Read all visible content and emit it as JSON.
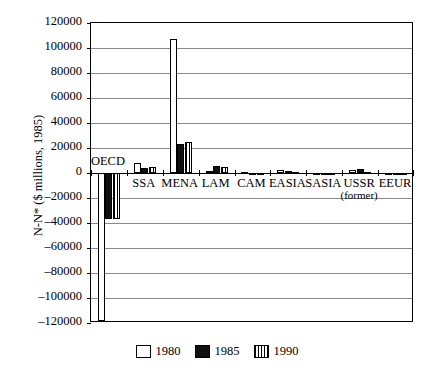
{
  "chart_data": {
    "type": "bar",
    "title": "",
    "xlabel": "",
    "ylabel": "N-N* ($ millions, 1985)",
    "ylim": [
      -120000,
      120000
    ],
    "ytick_step": 20000,
    "grid": true,
    "legend_position": "bottom",
    "categories": [
      "OECD",
      "SSA",
      "MENA",
      "LAM",
      "CAM",
      "EASIA",
      "SASIA",
      "USSR",
      "EEUR"
    ],
    "category_sublabels": {
      "USSR": "(former)"
    },
    "ytick_labels": [
      "120000",
      "100000",
      "80000",
      "60000",
      "40000",
      "20000",
      "0",
      "-20000",
      "-40000",
      "-60000",
      "-80000",
      "-100000",
      "-120000"
    ],
    "series": [
      {
        "name": "1980",
        "fill": "white",
        "values": [
          -118000,
          8000,
          107000,
          1500,
          700,
          2500,
          400,
          2500,
          300
        ]
      },
      {
        "name": "1985",
        "fill": "black",
        "values": [
          -37000,
          4000,
          23500,
          6000,
          -800,
          1800,
          -600,
          3500,
          -1500
        ]
      },
      {
        "name": "1990",
        "fill": "striped",
        "values": [
          -36500,
          4500,
          24500,
          5000,
          -300,
          1000,
          -400,
          900,
          -400
        ]
      }
    ]
  },
  "legend": {
    "items": [
      {
        "label": "1980",
        "pattern": "empty"
      },
      {
        "label": "1985",
        "pattern": "solid"
      },
      {
        "label": "1990",
        "pattern": "vertical-stripes"
      }
    ]
  }
}
